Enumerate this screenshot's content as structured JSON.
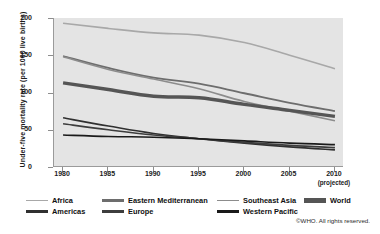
{
  "chart_data": {
    "type": "line",
    "title": "",
    "xlabel": "",
    "ylabel": "Under-five mortality rate (per 1000 live births)",
    "x": [
      1980,
      1985,
      1990,
      1995,
      2000,
      2005,
      2010
    ],
    "xtick_labels": [
      "1980",
      "1985",
      "1990",
      "1995",
      "2000",
      "2005",
      "2010"
    ],
    "xtick_sublabel_last": "(projected)",
    "ytick_labels": [
      "0",
      "50",
      "100",
      "150",
      "200"
    ],
    "ylim": [
      0,
      200
    ],
    "xlim": [
      1979,
      2011
    ],
    "grid": false,
    "legend_position": "below-axes",
    "series": [
      {
        "name": "Africa",
        "color": "#a8a8a8",
        "width": 1.6,
        "values": [
          193,
          186,
          180,
          177,
          167,
          150,
          132
        ]
      },
      {
        "name": "Eastern Mediterranean",
        "color": "#6d6d6d",
        "width": 1.8,
        "values": [
          149,
          133,
          120,
          112,
          99,
          86,
          75
        ]
      },
      {
        "name": "Southeast Asia",
        "color": "#8c8c8c",
        "width": 1.6,
        "values": [
          148,
          131,
          118,
          105,
          88,
          75,
          62
        ]
      },
      {
        "name": "World",
        "color": "#555555",
        "width": 3.4,
        "values": [
          113,
          104,
          95,
          93,
          84,
          76,
          68
        ]
      },
      {
        "name": "Americas",
        "color": "#303030",
        "width": 1.6,
        "values": [
          66,
          55,
          45,
          38,
          32,
          27,
          23
        ]
      },
      {
        "name": "Europe",
        "color": "#3d3d3d",
        "width": 1.6,
        "values": [
          58,
          50,
          43,
          38,
          33,
          29,
          26
        ]
      },
      {
        "name": "Western Pacific",
        "color": "#1a1a1a",
        "width": 1.6,
        "values": [
          43,
          41,
          40,
          38,
          35,
          32,
          30
        ]
      }
    ]
  },
  "legend": {
    "rows": [
      [
        {
          "label": "Africa",
          "color": "#a8a8a8",
          "width": 1.6,
          "left": 0,
          "swatch": 22
        },
        {
          "label": "Eastern Mediterranean",
          "color": "#6d6d6d",
          "width": 2.4,
          "left": 76,
          "swatch": 22
        },
        {
          "label": "Southeast Asia",
          "color": "#8c8c8c",
          "width": 1.8,
          "left": 191,
          "swatch": 22
        },
        {
          "label": "World",
          "color": "#555555",
          "width": 4.2,
          "left": 278,
          "swatch": 22
        }
      ],
      [
        {
          "label": "Americas",
          "color": "#303030",
          "width": 2.4,
          "left": 0,
          "swatch": 22
        },
        {
          "label": "Europe",
          "color": "#3d3d3d",
          "width": 2.4,
          "left": 76,
          "swatch": 22
        },
        {
          "label": "Western Pacific",
          "color": "#1a1a1a",
          "width": 2.4,
          "left": 191,
          "swatch": 22
        }
      ]
    ]
  },
  "copyright": "©WHO. All rights reserved."
}
